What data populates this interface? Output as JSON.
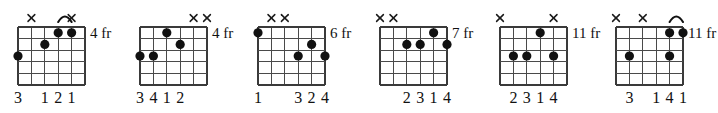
{
  "chart_data": {
    "type": "diagram",
    "subtype": "guitar-chord-chart",
    "strings": 6,
    "frets": 5,
    "diagrams": [
      {
        "index": 1,
        "fret_label": "4 fr",
        "x_offset": 0,
        "mutes": [
          5,
          2
        ],
        "barre": {
          "from_string": 3,
          "to_string": 2,
          "fret": 1
        },
        "dots": [
          {
            "string": 6,
            "fret": 3
          },
          {
            "string": 3,
            "fret": 1
          },
          {
            "string": 2,
            "fret": 1
          },
          {
            "string": 4,
            "fret": 2
          }
        ],
        "fingers": [
          {
            "string": 6,
            "label": "3"
          },
          {
            "string": 4,
            "label": "1"
          },
          {
            "string": 3,
            "label": "2"
          },
          {
            "string": 2,
            "label": "1"
          }
        ]
      },
      {
        "index": 2,
        "fret_label": "4 fr",
        "x_offset": 122,
        "mutes": [
          2,
          1
        ],
        "barre": null,
        "dots": [
          {
            "string": 6,
            "fret": 3
          },
          {
            "string": 5,
            "fret": 3
          },
          {
            "string": 4,
            "fret": 1
          },
          {
            "string": 3,
            "fret": 2
          }
        ],
        "fingers": [
          {
            "string": 6,
            "label": "3"
          },
          {
            "string": 5,
            "label": "4"
          },
          {
            "string": 4,
            "label": "1"
          },
          {
            "string": 3,
            "label": "2"
          }
        ]
      },
      {
        "index": 3,
        "fret_label": "6 fr",
        "x_offset": 240,
        "mutes": [
          5,
          4
        ],
        "barre": null,
        "dots": [
          {
            "string": 6,
            "fret": 1
          },
          {
            "string": 3,
            "fret": 3
          },
          {
            "string": 2,
            "fret": 2
          },
          {
            "string": 1,
            "fret": 3
          }
        ],
        "fingers": [
          {
            "string": 6,
            "label": "1"
          },
          {
            "string": 3,
            "label": "3"
          },
          {
            "string": 2,
            "label": "2"
          },
          {
            "string": 1,
            "label": "4"
          }
        ]
      },
      {
        "index": 4,
        "fret_label": "7 fr",
        "x_offset": 362,
        "mutes": [
          6,
          5
        ],
        "barre": null,
        "dots": [
          {
            "string": 4,
            "fret": 2
          },
          {
            "string": 3,
            "fret": 2
          },
          {
            "string": 2,
            "fret": 1
          },
          {
            "string": 1,
            "fret": 2
          }
        ],
        "fingers": [
          {
            "string": 4,
            "label": "2"
          },
          {
            "string": 3,
            "label": "3"
          },
          {
            "string": 2,
            "label": "1"
          },
          {
            "string": 1,
            "label": "4"
          }
        ]
      },
      {
        "index": 5,
        "fret_label": "11 fr",
        "x_offset": 482,
        "mutes": [
          6,
          2
        ],
        "barre": null,
        "dots": [
          {
            "string": 5,
            "fret": 3
          },
          {
            "string": 4,
            "fret": 3
          },
          {
            "string": 3,
            "fret": 1
          },
          {
            "string": 2,
            "fret": 3
          }
        ],
        "fingers": [
          {
            "string": 5,
            "label": "2"
          },
          {
            "string": 4,
            "label": "3"
          },
          {
            "string": 3,
            "label": "1"
          },
          {
            "string": 2,
            "label": "4"
          }
        ]
      },
      {
        "index": 6,
        "fret_label": "11 fr",
        "x_offset": 598,
        "mutes": [
          6,
          4
        ],
        "barre": {
          "from_string": 2,
          "to_string": 1,
          "fret": 1
        },
        "dots": [
          {
            "string": 5,
            "fret": 3
          },
          {
            "string": 2,
            "fret": 1
          },
          {
            "string": 2,
            "fret": 3
          },
          {
            "string": 1,
            "fret": 1
          }
        ],
        "fingers": [
          {
            "string": 5,
            "label": "3"
          },
          {
            "string": 3,
            "label": "1"
          },
          {
            "string": 2,
            "label": "4"
          },
          {
            "string": 1,
            "label": "1"
          }
        ]
      }
    ]
  }
}
